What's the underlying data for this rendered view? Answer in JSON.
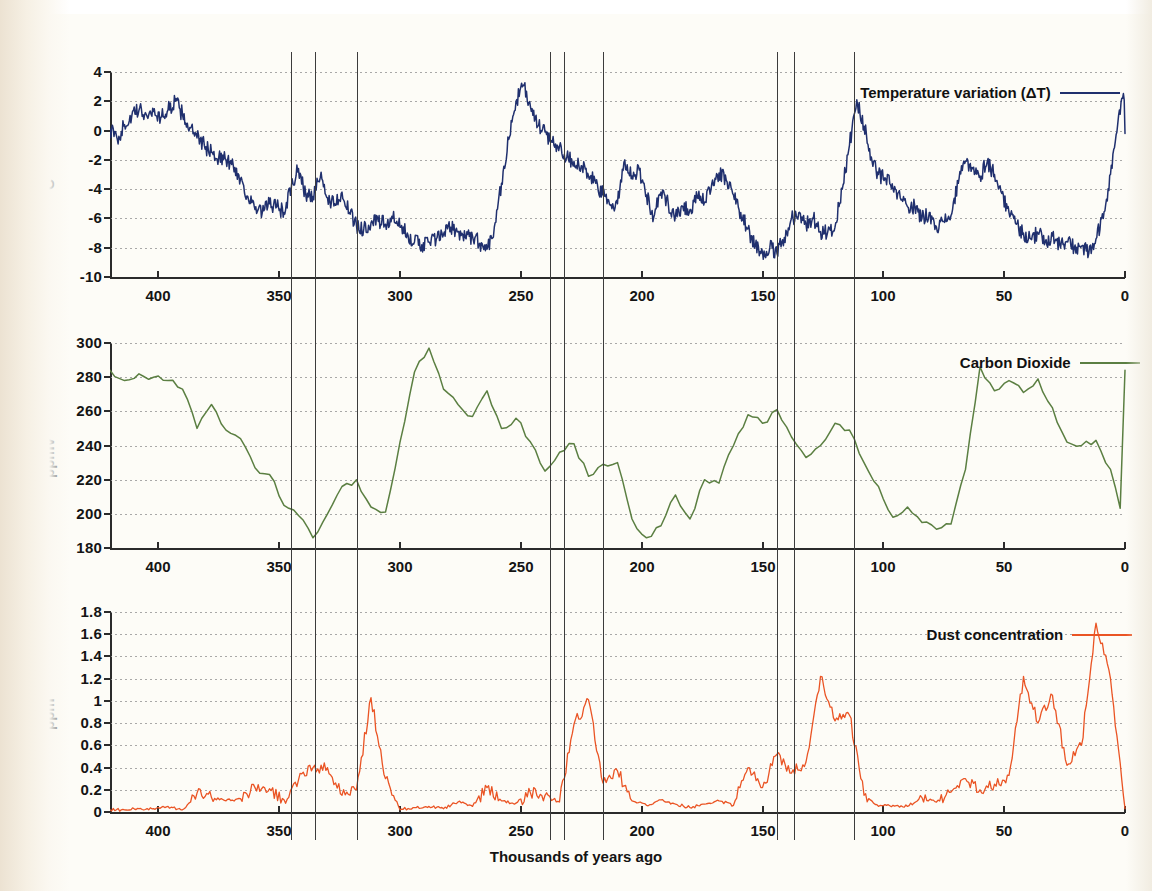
{
  "figure": {
    "xlabel": "Thousands of years ago",
    "background_color": "#fdfcf7"
  },
  "chart_data": [
    {
      "type": "line",
      "id": "temperature",
      "title": "",
      "legend": "Temperature variation (ΔT)",
      "color": "#20306e",
      "ylabel": "°C",
      "xlabel": "Thousands of years ago",
      "ylim": [
        -10,
        4
      ],
      "xlim": [
        420,
        0
      ],
      "yticks": [
        4,
        2,
        0,
        -2,
        -4,
        -6,
        -8,
        -10
      ],
      "xticks": [
        400,
        350,
        300,
        250,
        200,
        150,
        100,
        50,
        0
      ],
      "grid": true,
      "legend_position": "top-right",
      "x": [
        420,
        417,
        414,
        411,
        408,
        405,
        402,
        399,
        396,
        393,
        390,
        387,
        384,
        381,
        378,
        375,
        372,
        369,
        366,
        363,
        360,
        357,
        354,
        351,
        348,
        345,
        342,
        339,
        336,
        333,
        330,
        327,
        324,
        321,
        318,
        315,
        312,
        309,
        306,
        303,
        300,
        297,
        294,
        291,
        288,
        285,
        282,
        279,
        276,
        273,
        270,
        267,
        264,
        261,
        258,
        255,
        252,
        249,
        246,
        243,
        240,
        237,
        234,
        231,
        228,
        225,
        222,
        219,
        216,
        213,
        210,
        207,
        204,
        201,
        198,
        195,
        192,
        189,
        186,
        183,
        180,
        177,
        174,
        171,
        168,
        165,
        162,
        159,
        156,
        153,
        150,
        147,
        144,
        141,
        138,
        135,
        132,
        129,
        126,
        123,
        120,
        117,
        114,
        111,
        108,
        105,
        102,
        99,
        96,
        93,
        90,
        87,
        84,
        81,
        78,
        75,
        72,
        69,
        66,
        63,
        60,
        57,
        54,
        51,
        48,
        45,
        42,
        39,
        36,
        33,
        30,
        27,
        24,
        21,
        18,
        15,
        12,
        9,
        6,
        3,
        0
      ],
      "y": [
        0.1,
        -0.6,
        0.4,
        1.0,
        1.4,
        1.1,
        1.3,
        0.9,
        1.4,
        2.0,
        1.1,
        0.2,
        -0.5,
        -1.0,
        -1.5,
        -1.8,
        -2.0,
        -2.4,
        -3.3,
        -4.5,
        -5.4,
        -5.6,
        -5.0,
        -5.2,
        -5.6,
        -3.9,
        -2.6,
        -4.4,
        -4.5,
        -3.2,
        -4.6,
        -5.0,
        -4.2,
        -5.6,
        -6.5,
        -6.7,
        -6.3,
        -6.2,
        -6.4,
        -6.0,
        -6.6,
        -7.0,
        -7.6,
        -7.8,
        -7.6,
        -7.4,
        -7.1,
        -6.6,
        -6.9,
        -7.3,
        -7.2,
        -7.7,
        -8.1,
        -6.6,
        -3.6,
        -0.6,
        2.0,
        3.1,
        1.6,
        0.3,
        -0.1,
        -0.8,
        -1.1,
        -1.8,
        -2.1,
        -2.4,
        -3.1,
        -3.6,
        -4.4,
        -5.1,
        -5.0,
        -2.0,
        -3.1,
        -2.7,
        -4.4,
        -5.9,
        -4.2,
        -5.0,
        -5.8,
        -5.2,
        -5.4,
        -4.6,
        -4.9,
        -3.6,
        -2.9,
        -3.4,
        -4.4,
        -5.6,
        -6.7,
        -7.9,
        -8.3,
        -8.0,
        -8.4,
        -7.3,
        -6.0,
        -5.6,
        -6.4,
        -6.0,
        -6.9,
        -6.9,
        -6.6,
        -4.0,
        -1.0,
        2.1,
        0.3,
        -1.8,
        -3.0,
        -3.3,
        -4.0,
        -4.6,
        -5.2,
        -5.2,
        -6.0,
        -5.6,
        -6.6,
        -6.2,
        -5.8,
        -3.6,
        -2.1,
        -2.6,
        -3.1,
        -2.1,
        -3.0,
        -4.3,
        -5.6,
        -6.4,
        -7.0,
        -7.4,
        -7.0,
        -7.6,
        -7.2,
        -7.8,
        -7.6,
        -8.0,
        -7.9,
        -8.4,
        -7.4,
        -6.0,
        -3.0,
        0.5,
        2.7,
        1.9,
        0.8,
        -0.6,
        -1.9,
        -3.0,
        -4.0,
        -4.4,
        -5.1,
        -4.2,
        -4.6,
        -3.8,
        -4.4,
        -5.0,
        -4.7,
        -5.2,
        -4.4,
        -3.5,
        -4.2,
        -5.0,
        -5.6,
        -6.2,
        -5.8,
        -6.4,
        -7.1,
        -7.0,
        -7.6,
        -7.3,
        -6.8,
        -7.4,
        -6.6,
        -6.0,
        -6.7,
        -7.4,
        -7.0,
        -7.8,
        -7.4,
        -8.0,
        -7.6,
        -7.0,
        -6.4,
        -5.8,
        -4.2,
        -1.0,
        1.3,
        0.4,
        0.9,
        -0.1,
        0.6,
        2.2,
        0.3,
        1.0,
        0.2,
        0.7,
        -0.2
      ]
    },
    {
      "type": "line",
      "id": "carbon_dioxide",
      "title": "",
      "legend": "Carbon Dioxide",
      "color": "#5b7f42",
      "ylabel": "ppmv",
      "xlabel": "Thousands of years ago",
      "ylim": [
        180,
        300
      ],
      "xlim": [
        420,
        0
      ],
      "yticks": [
        300,
        280,
        260,
        240,
        220,
        200,
        180
      ],
      "xticks": [
        400,
        350,
        300,
        250,
        200,
        150,
        100,
        50,
        0
      ],
      "grid": true,
      "legend_position": "top-right",
      "x": [
        420,
        414,
        408,
        402,
        396,
        390,
        384,
        378,
        372,
        366,
        360,
        354,
        348,
        342,
        336,
        330,
        324,
        318,
        312,
        306,
        300,
        294,
        288,
        282,
        276,
        270,
        264,
        258,
        252,
        246,
        240,
        234,
        228,
        222,
        216,
        210,
        204,
        198,
        192,
        186,
        180,
        174,
        168,
        162,
        156,
        150,
        144,
        138,
        132,
        126,
        120,
        114,
        108,
        102,
        96,
        90,
        84,
        78,
        72,
        66,
        60,
        54,
        48,
        42,
        36,
        30,
        24,
        18,
        12,
        6,
        0
      ],
      "y": [
        284,
        278,
        282,
        280,
        278,
        273,
        250,
        264,
        249,
        244,
        227,
        223,
        205,
        199,
        186,
        200,
        216,
        220,
        204,
        201,
        242,
        283,
        297,
        273,
        264,
        257,
        272,
        250,
        256,
        242,
        225,
        236,
        241,
        222,
        229,
        230,
        197,
        186,
        193,
        211,
        197,
        220,
        218,
        240,
        258,
        253,
        261,
        245,
        233,
        240,
        253,
        249,
        230,
        216,
        198,
        204,
        195,
        191,
        194,
        226,
        286,
        272,
        278,
        271,
        279,
        262,
        242,
        240,
        243,
        226,
        193,
        221,
        196,
        219,
        212,
        228,
        210,
        185,
        182,
        222,
        250,
        265,
        284
      ]
    },
    {
      "type": "line",
      "id": "dust_concentration",
      "title": "",
      "legend": "Dust concentration",
      "color": "#ea5424",
      "ylabel": "ppm",
      "xlabel": "Thousands of years ago",
      "ylim": [
        0,
        1.8
      ],
      "xlim": [
        420,
        0
      ],
      "yticks": [
        1.8,
        1.6,
        1.4,
        1.2,
        1,
        0.8,
        0.6,
        0.4,
        0.2,
        0
      ],
      "xticks": [
        400,
        350,
        300,
        250,
        200,
        150,
        100,
        50,
        0
      ],
      "grid": true,
      "legend_position": "top-right",
      "x": [
        420,
        414,
        408,
        402,
        396,
        390,
        384,
        378,
        372,
        366,
        360,
        354,
        348,
        342,
        336,
        330,
        324,
        318,
        312,
        306,
        300,
        294,
        288,
        282,
        276,
        270,
        264,
        258,
        252,
        246,
        240,
        234,
        228,
        222,
        216,
        210,
        204,
        198,
        192,
        186,
        180,
        174,
        168,
        162,
        156,
        150,
        144,
        138,
        132,
        126,
        120,
        114,
        108,
        102,
        96,
        90,
        84,
        78,
        72,
        66,
        60,
        54,
        48,
        42,
        36,
        30,
        24,
        18,
        12,
        6,
        0
      ],
      "y": [
        0.02,
        0.02,
        0.03,
        0.03,
        0.05,
        0.02,
        0.17,
        0.13,
        0.1,
        0.12,
        0.22,
        0.21,
        0.11,
        0.29,
        0.4,
        0.4,
        0.15,
        0.2,
        1.03,
        0.3,
        0.02,
        0.04,
        0.05,
        0.03,
        0.09,
        0.05,
        0.22,
        0.1,
        0.08,
        0.17,
        0.15,
        0.09,
        0.79,
        1.01,
        0.26,
        0.37,
        0.1,
        0.06,
        0.11,
        0.07,
        0.04,
        0.07,
        0.1,
        0.06,
        0.4,
        0.22,
        0.52,
        0.35,
        0.45,
        1.22,
        0.82,
        0.87,
        0.15,
        0.05,
        0.06,
        0.05,
        0.13,
        0.09,
        0.18,
        0.3,
        0.2,
        0.25,
        0.33,
        1.22,
        0.8,
        1.05,
        0.42,
        0.6,
        1.7,
        1.2,
        0.08,
        0.05,
        0.03
      ]
    }
  ],
  "reference_lines": {
    "label": "marine isotope stage boundaries",
    "positions_ka": [
      345,
      335,
      318,
      238,
      232,
      216,
      144,
      137,
      112
    ]
  },
  "axes": {
    "temperature": {
      "ylabel": "°C",
      "ytick_labels": [
        "4",
        "2",
        "0",
        "-2",
        "-4",
        "-6",
        "-8",
        "-10"
      ]
    },
    "carbon_dioxide": {
      "ylabel": "ppmv",
      "ytick_labels": [
        "300",
        "280",
        "260",
        "240",
        "220",
        "200",
        "180"
      ]
    },
    "dust_concentration": {
      "ylabel": "ppm",
      "ytick_labels": [
        "1.8",
        "1.6",
        "1.4",
        "1.2",
        "1",
        "0.8",
        "0.6",
        "0.4",
        "0.2",
        "0"
      ]
    },
    "xtick_labels": [
      "400",
      "350",
      "300",
      "250",
      "200",
      "150",
      "100",
      "50",
      "0"
    ]
  }
}
